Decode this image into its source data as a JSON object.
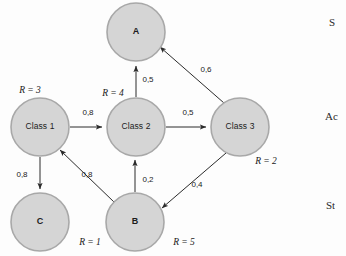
{
  "diagram": {
    "type": "directed-graph",
    "title_visible": false,
    "colors": {
      "node_fill": "#d5d5d5",
      "node_stroke": "#a8a8a8",
      "edge": "#2b2b2b",
      "text": "#1c1c1c",
      "background": "#fdfdfd"
    },
    "nodes": [
      {
        "id": "A",
        "label": "A",
        "cx": 136,
        "cy": 32,
        "r": 29,
        "rank": null,
        "rank_x": 0,
        "rank_y": 0
      },
      {
        "id": "Class1",
        "label": "Class 1",
        "cx": 40,
        "cy": 127,
        "r": 29,
        "rank": "R = 3",
        "rank_x": 30,
        "rank_y": 91
      },
      {
        "id": "Class2",
        "label": "Class 2",
        "cx": 136,
        "cy": 127,
        "r": 29,
        "rank": "R = 4",
        "rank_x": 113,
        "rank_y": 94
      },
      {
        "id": "Class3",
        "label": "Class 3",
        "cx": 240,
        "cy": 127,
        "r": 29,
        "rank": "R = 2",
        "rank_x": 266,
        "rank_y": 162
      },
      {
        "id": "B",
        "label": "B",
        "cx": 135,
        "cy": 222,
        "r": 29,
        "rank": "R = 5",
        "rank_x": 184,
        "rank_y": 243
      },
      {
        "id": "C",
        "label": "C",
        "cx": 40,
        "cy": 222,
        "r": 29,
        "rank": "R = 1",
        "rank_x": 90,
        "rank_y": 243
      }
    ],
    "edges": [
      {
        "id": "class1-class2",
        "from": "Class 1",
        "to": "Class 2",
        "weight": "0,8",
        "label_x": 88,
        "label_y": 113
      },
      {
        "id": "class2-class3",
        "from": "Class 2",
        "to": "Class 3",
        "weight": "0,5",
        "label_x": 188,
        "label_y": 113
      },
      {
        "id": "class2-a",
        "from": "Class 2",
        "to": "A",
        "weight": "0,5",
        "label_x": 148,
        "label_y": 80
      },
      {
        "id": "class3-a",
        "from": "Class 3",
        "to": "A",
        "weight": "0,6",
        "label_x": 206,
        "label_y": 70
      },
      {
        "id": "class1-c",
        "from": "Class 1",
        "to": "C",
        "weight": "0,8",
        "label_x": 22,
        "label_y": 175
      },
      {
        "id": "b-class1",
        "from": "B",
        "to": "Class 1",
        "weight": "0,8",
        "label_x": 87,
        "label_y": 175
      },
      {
        "id": "b-class2",
        "from": "B",
        "to": "Class 2",
        "weight": "0,2",
        "label_x": 148,
        "label_y": 180
      },
      {
        "id": "class3-b",
        "from": "Class 3",
        "to": "B",
        "weight": "0,4",
        "label_x": 197,
        "label_y": 185
      }
    ],
    "side_fragments": [
      {
        "id": "fragment-top",
        "text": "S",
        "x": 329,
        "y": 16
      },
      {
        "id": "fragment-middle",
        "text": "Ac",
        "x": 325,
        "y": 110
      },
      {
        "id": "fragment-bottom",
        "text": "St",
        "x": 326,
        "y": 199
      }
    ]
  }
}
